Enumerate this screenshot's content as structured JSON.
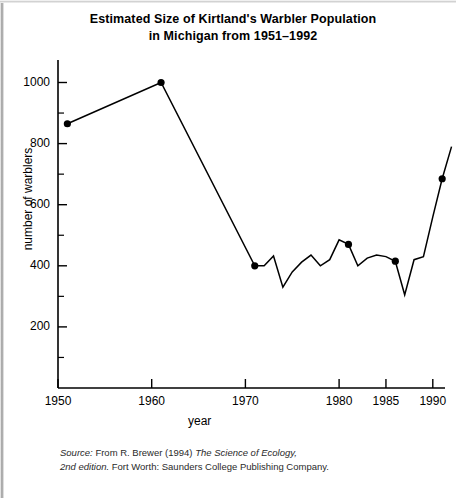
{
  "figure": {
    "title_line1": "Estimated Size of Kirtland's Warbler Population",
    "title_line2": "in Michigan from 1951–1992",
    "source_line1_italic": "Source:",
    "source_line1_rest": " From R. Brewer (1994) ",
    "source_line1_italic2": "The Science of Ecology,",
    "source_line2_italic": "2nd edition.",
    "source_line2_rest": " Fort Worth: Saunders College Publishing Company.",
    "line_color": "#000000",
    "marker_color": "#000000",
    "axis_color": "#000000",
    "background_color": "#ffffff"
  },
  "chart_data": {
    "type": "line",
    "xlabel": "year",
    "ylabel": "number of warblers",
    "xlim": [
      1948,
      1992.5
    ],
    "ylim": [
      0,
      1060
    ],
    "grid": false,
    "legend": null,
    "x_ticks_major": [
      1950,
      1960,
      1970,
      1980,
      1985,
      1990
    ],
    "x_tick_labels": [
      "1950",
      "1960",
      "1970",
      "1980",
      "1985",
      "1990"
    ],
    "y_ticks_major": [
      200,
      400,
      600,
      800,
      1000
    ],
    "y_tick_labels": [
      "200",
      "400",
      "600",
      "800",
      "1000"
    ],
    "y_ticks_minor": [
      100,
      300,
      500,
      700,
      900
    ],
    "marked_points": [
      {
        "x": 1951,
        "y": 865
      },
      {
        "x": 1961,
        "y": 1000
      },
      {
        "x": 1971,
        "y": 400
      },
      {
        "x": 1981,
        "y": 470
      },
      {
        "x": 1986,
        "y": 415
      },
      {
        "x": 1991,
        "y": 685
      }
    ],
    "x": [
      1951,
      1961,
      1971,
      1972,
      1973,
      1974,
      1975,
      1976,
      1977,
      1978,
      1979,
      1980,
      1981,
      1982,
      1983,
      1984,
      1985,
      1986,
      1987,
      1988,
      1989,
      1990,
      1991,
      1992
    ],
    "values": [
      865,
      1000,
      400,
      400,
      432,
      330,
      380,
      412,
      435,
      400,
      420,
      485,
      470,
      400,
      425,
      435,
      430,
      415,
      305,
      420,
      430,
      560,
      685,
      790
    ],
    "series": [
      {
        "name": "number of warblers",
        "values": [
          865,
          1000,
          400,
          400,
          432,
          330,
          380,
          412,
          435,
          400,
          420,
          485,
          470,
          400,
          425,
          435,
          430,
          415,
          305,
          420,
          430,
          560,
          685,
          790
        ]
      }
    ]
  }
}
